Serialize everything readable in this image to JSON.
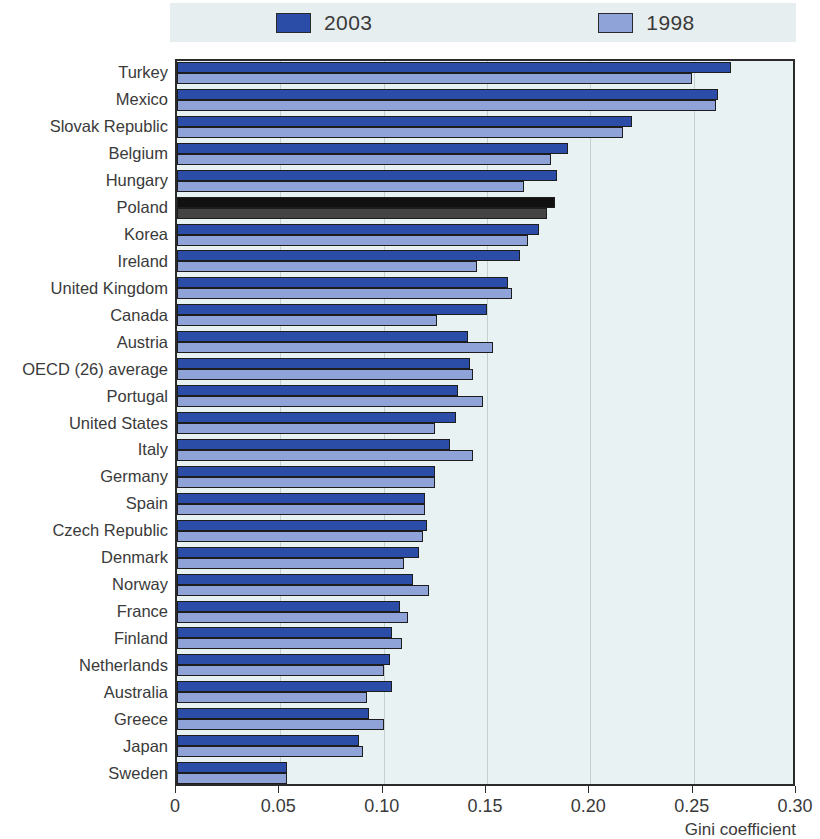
{
  "chart_data": {
    "type": "bar",
    "orientation": "horizontal",
    "title": "",
    "xlabel": "Gini coefficient",
    "ylabel": "",
    "xlim": [
      0,
      0.3
    ],
    "xticks": [
      0,
      0.05,
      0.1,
      0.15,
      0.2,
      0.25,
      0.3
    ],
    "xticklabels": [
      "0",
      "0.05",
      "0.10",
      "0.15",
      "0.20",
      "0.25",
      "0.30"
    ],
    "grid": true,
    "legend_position": "top",
    "categories": [
      "Turkey",
      "Mexico",
      "Slovak Republic",
      "Belgium",
      "Hungary",
      "Poland",
      "Korea",
      "Ireland",
      "United Kingdom",
      "Canada",
      "Austria",
      "OECD (26) average",
      "Portugal",
      "United States",
      "Italy",
      "Germany",
      "Spain",
      "Czech Republic",
      "Denmark",
      "Norway",
      "France",
      "Finland",
      "Netherlands",
      "Australia",
      "Greece",
      "Japan",
      "Sweden"
    ],
    "series": [
      {
        "name": "2003",
        "color": "#2b4da8",
        "values": [
          0.268,
          0.262,
          0.22,
          0.189,
          0.184,
          0.183,
          0.175,
          0.166,
          0.16,
          0.15,
          0.141,
          0.142,
          0.136,
          0.135,
          0.132,
          0.125,
          0.12,
          0.121,
          0.117,
          0.114,
          0.108,
          0.104,
          0.103,
          0.104,
          0.093,
          0.088,
          0.053
        ]
      },
      {
        "name": "1998",
        "color": "#8fa3d8",
        "values": [
          0.249,
          0.261,
          0.216,
          0.181,
          0.168,
          0.179,
          0.17,
          0.145,
          0.162,
          0.126,
          0.153,
          0.143,
          0.148,
          0.125,
          0.143,
          0.125,
          0.12,
          0.119,
          0.11,
          0.122,
          0.112,
          0.109,
          0.1,
          0.092,
          0.1,
          0.09,
          0.053
        ]
      }
    ],
    "highlight": {
      "category": "Poland",
      "color_2003": "#111111",
      "color_1998": "#444444"
    }
  },
  "legend": {
    "items": [
      {
        "label": "2003",
        "color": "#2b4da8"
      },
      {
        "label": "1998",
        "color": "#8fa3d8"
      }
    ]
  },
  "axis": {
    "title": "Gini coefficient"
  },
  "colors": {
    "plot_background": "#e8f2f2",
    "legend_background": "#e7eef0",
    "frame": "#2b2b2b",
    "text": "#3a3a3a"
  }
}
